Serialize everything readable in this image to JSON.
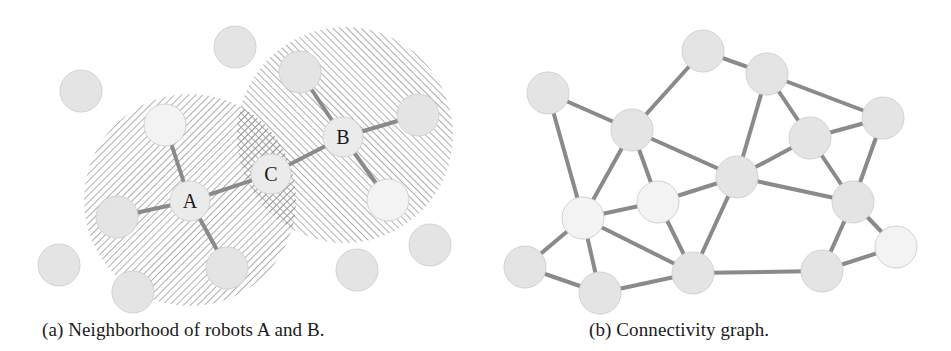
{
  "figure": {
    "panels": [
      {
        "id": "a",
        "caption": "(a) Neighborhood of robots A and B.",
        "labeled_robots": [
          {
            "label": "A",
            "x": 190,
            "y": 201
          },
          {
            "label": "B",
            "x": 343,
            "y": 137
          },
          {
            "label": "C",
            "x": 271,
            "y": 174
          }
        ],
        "neighborhoods": [
          {
            "center": "A",
            "cx": 190,
            "cy": 200,
            "r": 106,
            "hatch": "diagonal-down"
          },
          {
            "center": "B",
            "cx": 345,
            "cy": 135,
            "r": 108,
            "hatch": "diagonal-up"
          }
        ],
        "robots": [
          {
            "id": "p1",
            "x": 235,
            "y": 47
          },
          {
            "id": "p2",
            "x": 81,
            "y": 91
          },
          {
            "id": "p3",
            "x": 165,
            "y": 125,
            "faded": true
          },
          {
            "id": "p4",
            "x": 300,
            "y": 72
          },
          {
            "id": "p5",
            "x": 418,
            "y": 115
          },
          {
            "id": "p6",
            "x": 388,
            "y": 200,
            "faded": true
          },
          {
            "id": "p7",
            "x": 117,
            "y": 217
          },
          {
            "id": "p8",
            "x": 227,
            "y": 268
          },
          {
            "id": "p9",
            "x": 59,
            "y": 265
          },
          {
            "id": "p10",
            "x": 133,
            "y": 292
          },
          {
            "id": "p11",
            "x": 357,
            "y": 270
          },
          {
            "id": "p12",
            "x": 430,
            "y": 245
          }
        ],
        "edges": [
          [
            "A",
            "p3"
          ],
          [
            "A",
            "p7"
          ],
          [
            "A",
            "p8"
          ],
          [
            "A",
            "C"
          ],
          [
            "B",
            "p4"
          ],
          [
            "B",
            "p5"
          ],
          [
            "B",
            "p6"
          ],
          [
            "B",
            "C"
          ]
        ]
      },
      {
        "id": "b",
        "caption": "(b) Connectivity graph.",
        "nodes": [
          {
            "id": "n1",
            "x": 703,
            "y": 51
          },
          {
            "id": "n2",
            "x": 767,
            "y": 74
          },
          {
            "id": "n3",
            "x": 548,
            "y": 93
          },
          {
            "id": "n4",
            "x": 632,
            "y": 130
          },
          {
            "id": "n5",
            "x": 883,
            "y": 118
          },
          {
            "id": "n6",
            "x": 810,
            "y": 138
          },
          {
            "id": "n7",
            "x": 737,
            "y": 177
          },
          {
            "id": "n8",
            "x": 658,
            "y": 202,
            "faded": true
          },
          {
            "id": "n9",
            "x": 583,
            "y": 218,
            "faded": true
          },
          {
            "id": "n10",
            "x": 853,
            "y": 202
          },
          {
            "id": "n11",
            "x": 896,
            "y": 247,
            "faded": true
          },
          {
            "id": "n12",
            "x": 525,
            "y": 267
          },
          {
            "id": "n13",
            "x": 600,
            "y": 293
          },
          {
            "id": "n14",
            "x": 693,
            "y": 273
          },
          {
            "id": "n15",
            "x": 822,
            "y": 271
          }
        ],
        "edges": [
          [
            "n3",
            "n4"
          ],
          [
            "n3",
            "n9"
          ],
          [
            "n4",
            "n1"
          ],
          [
            "n4",
            "n7"
          ],
          [
            "n4",
            "n9"
          ],
          [
            "n4",
            "n8"
          ],
          [
            "n1",
            "n2"
          ],
          [
            "n2",
            "n5"
          ],
          [
            "n2",
            "n6"
          ],
          [
            "n2",
            "n7"
          ],
          [
            "n6",
            "n5"
          ],
          [
            "n6",
            "n7"
          ],
          [
            "n6",
            "n10"
          ],
          [
            "n5",
            "n10"
          ],
          [
            "n7",
            "n8"
          ],
          [
            "n7",
            "n10"
          ],
          [
            "n7",
            "n14"
          ],
          [
            "n8",
            "n9"
          ],
          [
            "n8",
            "n14"
          ],
          [
            "n9",
            "n12"
          ],
          [
            "n9",
            "n13"
          ],
          [
            "n9",
            "n14"
          ],
          [
            "n12",
            "n13"
          ],
          [
            "n13",
            "n14"
          ],
          [
            "n14",
            "n15"
          ],
          [
            "n10",
            "n15"
          ],
          [
            "n10",
            "n11"
          ],
          [
            "n15",
            "n11"
          ]
        ]
      }
    ],
    "style": {
      "node_radius": 21,
      "node_fill": "#e4e4e4",
      "node_stroke": "#d2d2d2",
      "faded_fill": "#f3f3f3",
      "edge_color": "#8a8a8a",
      "edge_width": 4,
      "hatch_color": "#9a9a9a",
      "label_color": "#1a1a1a"
    }
  }
}
